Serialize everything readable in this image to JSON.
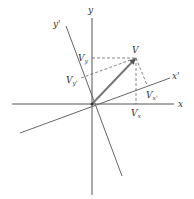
{
  "diagram": {
    "type": "coordinate-rotation-vector-components",
    "colors": {
      "background": "#ffffff",
      "axis": "#555555",
      "rotated_axis": "#666666",
      "vector": "#777777",
      "dashed": "#666666",
      "text": "#333333"
    },
    "origin": {
      "x": 92,
      "y": 104
    },
    "axes": {
      "x": {
        "label": "x",
        "from": [
          12,
          104
        ],
        "to": [
          174,
          104
        ],
        "label_pos": [
          178,
          107
        ]
      },
      "y": {
        "label": "y",
        "from": [
          92,
          18
        ],
        "to": [
          92,
          195
        ],
        "label_pos": [
          88,
          13
        ]
      },
      "x_prime": {
        "label": "x'",
        "from": [
          20,
          133
        ],
        "to": [
          170,
          78
        ],
        "label_pos": [
          172,
          79
        ]
      },
      "y_prime": {
        "label": "y'",
        "from": [
          66,
          26
        ],
        "to": [
          122,
          176
        ],
        "label_pos": [
          53,
          27
        ]
      }
    },
    "vector": {
      "label": "V",
      "tip": [
        136,
        58
      ],
      "label_pos": [
        132,
        53
      ]
    },
    "components": {
      "V_x": {
        "base": "V",
        "sub": "x",
        "foot": [
          136,
          104
        ],
        "label_pos": [
          131,
          116
        ]
      },
      "V_y": {
        "base": "V",
        "sub": "y",
        "foot": [
          92,
          58
        ],
        "label_pos": [
          78,
          61
        ]
      },
      "V_x_prime": {
        "base": "V",
        "sub": "x'",
        "foot": [
          147,
          85
        ],
        "label_pos": [
          146,
          98
        ]
      },
      "V_y_prime": {
        "base": "V",
        "sub": "y'",
        "foot": [
          81,
          78
        ],
        "label_pos": [
          66,
          83
        ]
      }
    }
  }
}
